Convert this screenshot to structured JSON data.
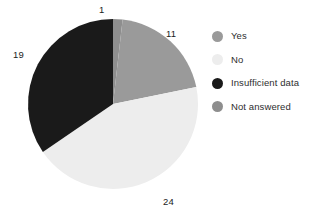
{
  "chart_data": {
    "type": "pie",
    "title": "",
    "labels": [
      "Yes",
      "No",
      "Insufficient data",
      "Not answered"
    ],
    "values": [
      11,
      24,
      19,
      1
    ],
    "total": 55,
    "colors": [
      "#9a9a9a",
      "#ededed",
      "#1a1a1a",
      "#8e8e8e"
    ],
    "data_labels": [
      "11",
      "24",
      "19",
      "1"
    ],
    "legend_position": "right",
    "grid": false,
    "start_angle_deg": 0,
    "direction": "clockwise",
    "slices": [
      {
        "label": "Not answered",
        "value": 1,
        "data_label": "1",
        "color": "#8e8e8e",
        "start_deg": 0,
        "end_deg": 6.5
      },
      {
        "label": "Yes",
        "value": 11,
        "data_label": "11",
        "color": "#9a9a9a",
        "start_deg": 6.5,
        "end_deg": 78.5
      },
      {
        "label": "No",
        "value": 24,
        "data_label": "24",
        "color": "#ededed",
        "start_deg": 78.5,
        "end_deg": 235.6
      },
      {
        "label": "Insufficient data",
        "value": 19,
        "data_label": "19",
        "color": "#1a1a1a",
        "start_deg": 235.6,
        "end_deg": 360
      }
    ]
  },
  "legend": {
    "items": [
      {
        "label": "Yes",
        "color": "#9a9a9a",
        "swatch_icon": "circle-swatch-icon"
      },
      {
        "label": "No",
        "color": "#ededed",
        "swatch_icon": "circle-swatch-icon"
      },
      {
        "label": "Insufficient data",
        "color": "#1a1a1a",
        "swatch_icon": "circle-swatch-icon"
      },
      {
        "label": "Not answered",
        "color": "#8e8e8e",
        "swatch_icon": "circle-swatch-icon"
      }
    ]
  },
  "style": {
    "background": "#ffffff",
    "label_color": "#1c1c1c",
    "legend_text_color": "#2e2e2e"
  },
  "geometry": {
    "center_x": 113,
    "center_y": 104,
    "radius": 85
  }
}
